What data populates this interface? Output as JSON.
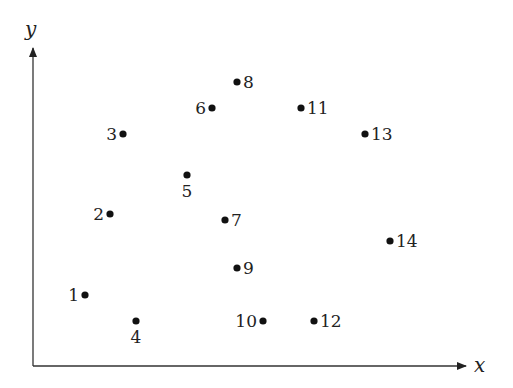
{
  "chart_data": {
    "type": "scatter",
    "title": "",
    "xlabel": "x",
    "ylabel": "y",
    "grid": false,
    "legend": null,
    "axes": {
      "origin_px": [
        33,
        366
      ],
      "x_end_px": 466,
      "y_end_px": 48,
      "color": "#333333"
    },
    "points": [
      {
        "label": "1",
        "px": [
          85,
          295
        ],
        "label_pos": "left"
      },
      {
        "label": "2",
        "px": [
          110,
          214
        ],
        "label_pos": "left"
      },
      {
        "label": "3",
        "px": [
          123,
          134
        ],
        "label_pos": "left"
      },
      {
        "label": "4",
        "px": [
          136,
          321
        ],
        "label_pos": "below"
      },
      {
        "label": "5",
        "px": [
          187,
          175
        ],
        "label_pos": "below"
      },
      {
        "label": "6",
        "px": [
          212,
          108
        ],
        "label_pos": "left"
      },
      {
        "label": "7",
        "px": [
          225,
          220
        ],
        "label_pos": "right"
      },
      {
        "label": "8",
        "px": [
          237,
          82
        ],
        "label_pos": "right"
      },
      {
        "label": "9",
        "px": [
          237,
          268
        ],
        "label_pos": "right"
      },
      {
        "label": "10",
        "px": [
          263,
          321
        ],
        "label_pos": "left"
      },
      {
        "label": "11",
        "px": [
          301,
          108
        ],
        "label_pos": "right"
      },
      {
        "label": "12",
        "px": [
          314,
          321
        ],
        "label_pos": "right"
      },
      {
        "label": "13",
        "px": [
          365,
          134
        ],
        "label_pos": "right"
      },
      {
        "label": "14",
        "px": [
          390,
          241
        ],
        "label_pos": "right"
      }
    ],
    "point_color": "#111111"
  }
}
